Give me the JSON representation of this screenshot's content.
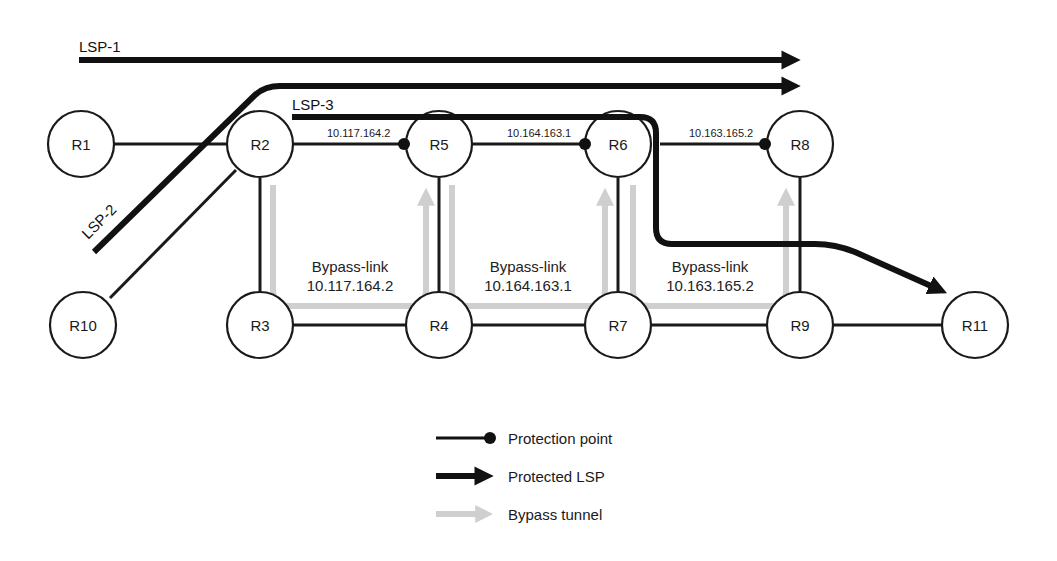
{
  "diagram": {
    "type": "MPLS fast-reroute link protection topology",
    "nodes": [
      {
        "id": "R1",
        "label": "R1"
      },
      {
        "id": "R2",
        "label": "R2"
      },
      {
        "id": "R3",
        "label": "R3"
      },
      {
        "id": "R4",
        "label": "R4"
      },
      {
        "id": "R5",
        "label": "R5"
      },
      {
        "id": "R6",
        "label": "R6"
      },
      {
        "id": "R7",
        "label": "R7"
      },
      {
        "id": "R8",
        "label": "R8"
      },
      {
        "id": "R9",
        "label": "R9"
      },
      {
        "id": "R10",
        "label": "R10"
      },
      {
        "id": "R11",
        "label": "R11"
      }
    ],
    "links": [
      [
        "R1",
        "R2"
      ],
      [
        "R2",
        "R5"
      ],
      [
        "R5",
        "R6"
      ],
      [
        "R6",
        "R8"
      ],
      [
        "R2",
        "R3"
      ],
      [
        "R5",
        "R4"
      ],
      [
        "R6",
        "R7"
      ],
      [
        "R8",
        "R9"
      ],
      [
        "R3",
        "R4"
      ],
      [
        "R4",
        "R7"
      ],
      [
        "R7",
        "R9"
      ],
      [
        "R9",
        "R11"
      ],
      [
        "R2",
        "R10"
      ]
    ],
    "protection_points": [
      {
        "label": "10.117.164.2",
        "link": [
          "R2",
          "R5"
        ]
      },
      {
        "label": "10.164.163.1",
        "link": [
          "R5",
          "R6"
        ]
      },
      {
        "label": "10.163.165.2",
        "link": [
          "R6",
          "R8"
        ]
      }
    ],
    "lsps": [
      {
        "label": "LSP-1"
      },
      {
        "label": "LSP-2"
      },
      {
        "label": "LSP-3"
      }
    ],
    "bypass_links": [
      {
        "title": "Bypass-link",
        "address": "10.117.164.2"
      },
      {
        "title": "Bypass-link",
        "address": "10.164.163.1"
      },
      {
        "title": "Bypass-link",
        "address": "10.163.165.2"
      }
    ]
  },
  "legend": {
    "items": [
      {
        "symbol": "line-with-dot",
        "label": "Protection point"
      },
      {
        "symbol": "thick-arrow",
        "label": "Protected LSP"
      },
      {
        "symbol": "gray-arrow",
        "label": "Bypass tunnel"
      }
    ]
  },
  "colors": {
    "line": "#1a1a1a",
    "lsp": "#111111",
    "bypass": "#cfcfcf",
    "background": "#ffffff"
  }
}
